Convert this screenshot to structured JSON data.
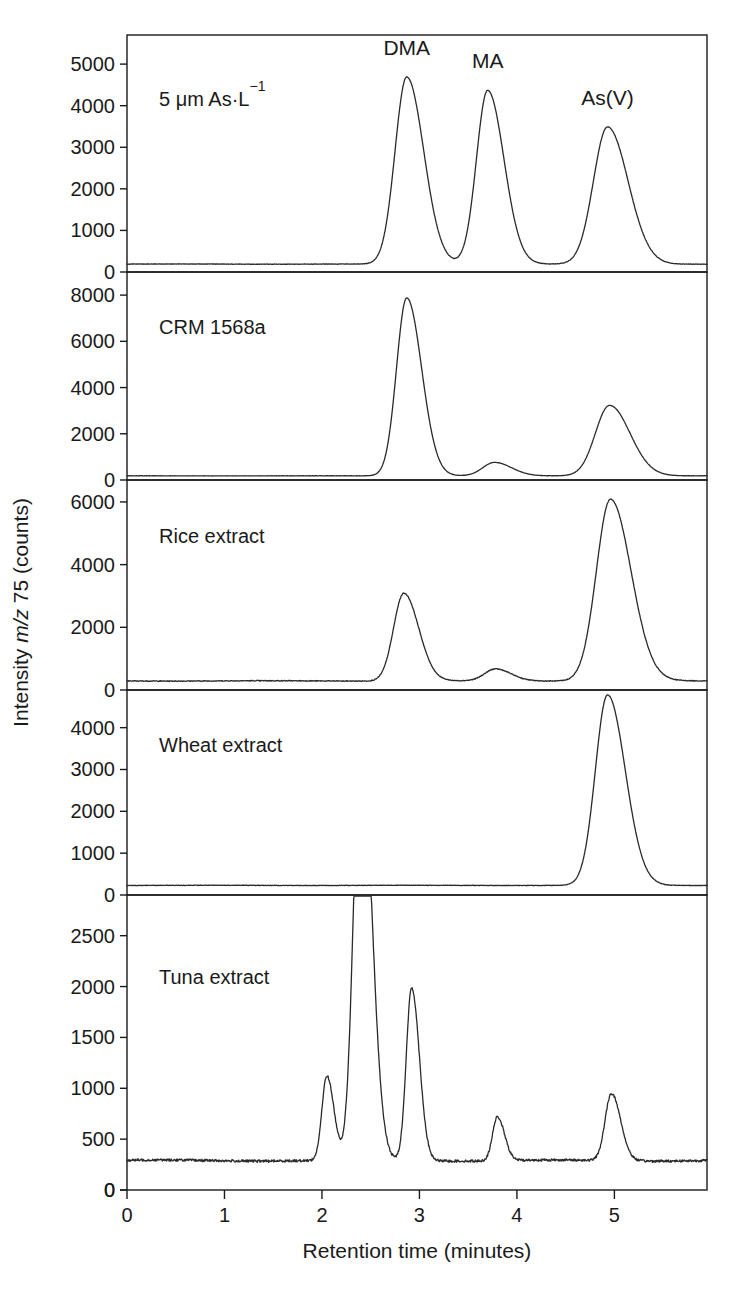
{
  "figure": {
    "y_axis_title": "Intensity m/z 75 (counts)",
    "y_axis_title_parts": {
      "pre": "Intensity ",
      "italic": "m/z",
      "post": " 75 (counts)"
    },
    "x_axis_title": "Retention time (minutes)",
    "x_tick_labels": [
      "0",
      "1",
      "2",
      "3",
      "4",
      "5"
    ],
    "peak_labels": [
      "DMA",
      "MA",
      "As(V)"
    ],
    "line_color": "#2a2a2a",
    "background_color": "#ffffff"
  },
  "chart_data": {
    "type": "line",
    "title": "",
    "xlabel": "Retention time (minutes)",
    "ylabel": "Intensity m/z 75 (counts)",
    "xlim": [
      0,
      5.95
    ],
    "xticks": [
      0,
      1,
      2,
      3,
      4,
      5
    ],
    "grid": false,
    "legend": "none",
    "annotations": [
      {
        "text": "DMA",
        "x": 2.87,
        "panel": 0
      },
      {
        "text": "MA",
        "x": 3.7,
        "panel": 0
      },
      {
        "text": "As(V)",
        "x": 4.93,
        "panel": 0
      }
    ],
    "panels": [
      {
        "label": "5 μm As·L⁻¹",
        "label_html": "5 μm As·L<sup>−1</sup>",
        "ylim": [
          0,
          5700
        ],
        "yticks": [
          0,
          1000,
          2000,
          3000,
          4000,
          5000
        ],
        "ytick_labels": [
          "0",
          "1000",
          "2000",
          "3000",
          "4000",
          "5000"
        ],
        "baseline": 190,
        "peaks": [
          {
            "name": "DMA",
            "retention_time": 2.87,
            "height": 4500,
            "width": 0.12
          },
          {
            "name": "MA",
            "retention_time": 3.7,
            "height": 4180,
            "width": 0.115
          },
          {
            "name": "As(V)",
            "retention_time": 4.93,
            "height": 3300,
            "width": 0.145
          }
        ]
      },
      {
        "label": "CRM 1568a",
        "ylim": [
          0,
          9000
        ],
        "yticks": [
          0,
          2000,
          4000,
          6000,
          8000
        ],
        "ytick_labels": [
          "0",
          "2000",
          "4000",
          "6000",
          "8000"
        ],
        "baseline": 180,
        "peaks": [
          {
            "name": "DMA",
            "retention_time": 2.87,
            "height": 7700,
            "width": 0.105
          },
          {
            "name": "MA",
            "retention_time": 3.77,
            "height": 580,
            "width": 0.12
          },
          {
            "name": "As(V)",
            "retention_time": 4.95,
            "height": 3050,
            "width": 0.145
          }
        ]
      },
      {
        "label": "Rice extract",
        "ylim": [
          0,
          6700
        ],
        "yticks": [
          0,
          2000,
          4000,
          6000
        ],
        "ytick_labels": [
          "0",
          "2000",
          "4000",
          "6000"
        ],
        "baseline": 290,
        "peaks": [
          {
            "name": "DMA",
            "retention_time": 2.84,
            "height": 2800,
            "width": 0.105
          },
          {
            "name": "MA",
            "retention_time": 3.78,
            "height": 380,
            "width": 0.11
          },
          {
            "name": "As(V)",
            "retention_time": 4.96,
            "height": 5800,
            "width": 0.145
          }
        ]
      },
      {
        "label": "Wheat extract",
        "ylim": [
          0,
          4900
        ],
        "yticks": [
          0,
          1000,
          2000,
          3000,
          4000
        ],
        "ytick_labels": [
          "0",
          "1000",
          "2000",
          "3000",
          "4000"
        ],
        "baseline": 230,
        "peaks": [
          {
            "name": "As(V)",
            "retention_time": 4.93,
            "height": 4550,
            "width": 0.125
          }
        ]
      },
      {
        "label": "Tuna extract",
        "ylim": [
          0,
          2900
        ],
        "yticks": [
          0,
          500,
          1000,
          1500,
          2000,
          2500
        ],
        "ytick_labels": [
          "0",
          "500",
          "1000",
          "1500",
          "2000",
          "2500"
        ],
        "baseline": 290,
        "peaks": [
          {
            "name": "unknown-1",
            "retention_time": 2.05,
            "height": 830,
            "width": 0.05
          },
          {
            "name": "arsenobetaine",
            "retention_time": 2.4,
            "height": 4200,
            "width": 0.075,
            "clipped": true
          },
          {
            "name": "unknown-2",
            "retention_time": 2.92,
            "height": 1700,
            "width": 0.055
          },
          {
            "name": "unknown-3",
            "retention_time": 3.8,
            "height": 430,
            "width": 0.05
          },
          {
            "name": "unknown-4",
            "retention_time": 4.97,
            "height": 660,
            "width": 0.065
          }
        ]
      }
    ]
  }
}
